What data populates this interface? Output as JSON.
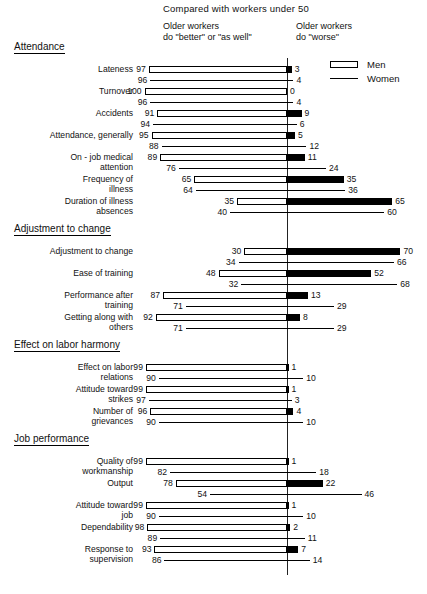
{
  "header": {
    "title": "Compared with workers under 50",
    "left_caption": "Older workers\ndo \"better\" or \"as well\"",
    "right_caption": "Older workers\ndo \"worse\""
  },
  "legend": {
    "men_label": "Men",
    "women_label": "Women",
    "men_swatch": "open-rectangle",
    "women_swatch": "solid-line"
  },
  "chart_data": {
    "type": "bar",
    "orientation": "horizontal",
    "subtype": "diverging-stacked-100",
    "title": "Compared with workers under 50",
    "xlabel": "",
    "ylabel": "",
    "xlim": [
      0,
      100
    ],
    "grid": false,
    "legend_position": "top-right",
    "axis_center_value": 0,
    "left_side_label": "Older workers do \"better\" or \"as well\"",
    "right_side_label": "Older workers do \"worse\"",
    "series": [
      {
        "name": "Men",
        "style": "open-bar"
      },
      {
        "name": "Women",
        "style": "line"
      }
    ],
    "groups": [
      {
        "title": "Attendance",
        "rows": [
          {
            "label": "Lateness",
            "men_better": 97,
            "men_worse": 3,
            "women_better": 96,
            "women_worse": 4
          },
          {
            "label": "Turnover",
            "men_better": 100,
            "men_worse": 0,
            "women_better": 96,
            "women_worse": 4
          },
          {
            "label": "Accidents",
            "men_better": 91,
            "men_worse": 9,
            "women_better": 94,
            "women_worse": 6
          },
          {
            "label": "Attendance, generally",
            "men_better": 95,
            "men_worse": 5,
            "women_better": 88,
            "women_worse": 12
          },
          {
            "label": "On - job medical\nattention",
            "men_better": 89,
            "men_worse": 11,
            "women_better": 76,
            "women_worse": 24
          },
          {
            "label": "Frequency of\nillness",
            "men_better": 65,
            "men_worse": 35,
            "women_better": 64,
            "women_worse": 36
          },
          {
            "label": "Duration of illness\nabsences",
            "men_better": 35,
            "men_worse": 65,
            "women_better": 40,
            "women_worse": 60
          }
        ]
      },
      {
        "title": "Adjustment to change",
        "rows": [
          {
            "label": "Adjustment to change",
            "men_better": 30,
            "men_worse": 70,
            "women_better": 34,
            "women_worse": 66
          },
          {
            "label": "Ease of training",
            "men_better": 48,
            "men_worse": 52,
            "women_better": 32,
            "women_worse": 68
          },
          {
            "label": "Performance after\ntraining",
            "men_better": 87,
            "men_worse": 13,
            "women_better": 71,
            "women_worse": 29
          },
          {
            "label": "Getting along with\nothers",
            "men_better": 92,
            "men_worse": 8,
            "women_better": 71,
            "women_worse": 29
          }
        ]
      },
      {
        "title": "Effect on labor harmony",
        "rows": [
          {
            "label": "Effect on labor\nrelations",
            "men_better": 99,
            "men_worse": 1,
            "women_better": 90,
            "women_worse": 10
          },
          {
            "label": "Attitude toward\nstrikes",
            "men_better": 99,
            "men_worse": 1,
            "women_better": 97,
            "women_worse": 3
          },
          {
            "label": "Number of\ngrievances",
            "men_better": 96,
            "men_worse": 4,
            "women_better": 90,
            "women_worse": 10
          }
        ]
      },
      {
        "title": "Job performance",
        "rows": [
          {
            "label": "Quality of\nworkmanship",
            "men_better": 99,
            "men_worse": 1,
            "women_better": 82,
            "women_worse": 18
          },
          {
            "label": "Output",
            "men_better": 78,
            "men_worse": 22,
            "women_better": 54,
            "women_worse": 46
          },
          {
            "label": "Attitude toward\njob",
            "men_better": 99,
            "men_worse": 1,
            "women_better": 90,
            "women_worse": 10
          },
          {
            "label": "Dependability",
            "men_better": 98,
            "men_worse": 2,
            "women_better": 89,
            "women_worse": 11
          },
          {
            "label": "Response to\nsupervision",
            "men_better": 93,
            "men_worse": 7,
            "women_better": 86,
            "women_worse": 14
          }
        ]
      }
    ]
  }
}
